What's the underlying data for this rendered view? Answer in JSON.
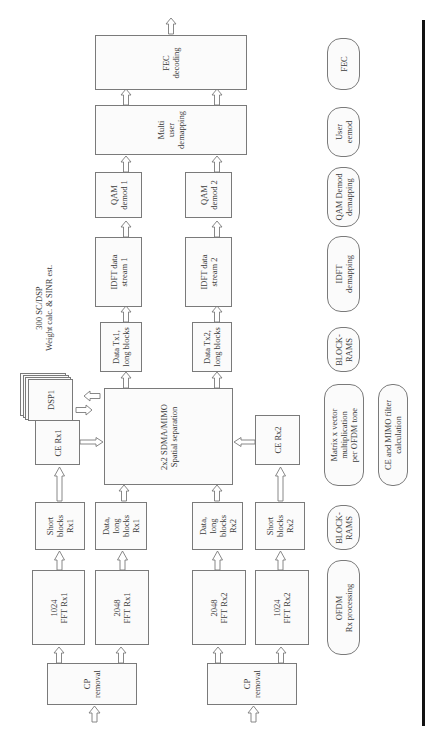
{
  "diagram": {
    "orientation": "rotated-90-ccw",
    "annotation": {
      "lines": [
        "300 SC/DSP",
        "Weight calc. & SINR est."
      ]
    },
    "blocks": {
      "fec_decoding": {
        "lines": [
          "FEC",
          "decoding"
        ]
      },
      "multi_user_demapping": {
        "lines": [
          "Multi",
          "user",
          "demapping"
        ]
      },
      "qam_demod_1": {
        "lines": [
          "QAM",
          "demod 1"
        ]
      },
      "qam_demod_2": {
        "lines": [
          "QAM",
          "demod 2"
        ]
      },
      "idft_stream_1": {
        "lines": [
          "IDFT data",
          "stream 1"
        ]
      },
      "idft_stream_2": {
        "lines": [
          "IDFT data",
          "stream 2"
        ]
      },
      "data_tx1": {
        "lines": [
          "Data Tx1,",
          "long blocks"
        ]
      },
      "data_tx2": {
        "lines": [
          "Data Tx2,",
          "long blocks"
        ]
      },
      "sdma": {
        "lines": [
          "2x2 SDMA/MIMO",
          "Spatial separation"
        ]
      },
      "dsp": {
        "lines": [
          "DSP1"
        ]
      },
      "ce_rx1": {
        "lines": [
          "CE Rx1"
        ]
      },
      "ce_rx2": {
        "lines": [
          "CE Rx2"
        ]
      },
      "short_blocks_rx1": {
        "lines": [
          "Short",
          "blocks",
          "Rx1"
        ]
      },
      "data_long_rx1": {
        "lines": [
          "Data,",
          "long",
          "blocks",
          "Rx1"
        ]
      },
      "data_long_rx2": {
        "lines": [
          "Data,",
          "long",
          "blocks",
          "Rx2"
        ]
      },
      "short_blocks_rx2": {
        "lines": [
          "Short",
          "blocks",
          "Rx2"
        ]
      },
      "fft_1024_rx1": {
        "lines": [
          "1024",
          "FFT Rx1"
        ]
      },
      "fft_2048_rx1": {
        "lines": [
          "2048",
          "FFT Rx1"
        ]
      },
      "fft_2048_rx2": {
        "lines": [
          "2048",
          "FFT Rx2"
        ]
      },
      "fft_1024_rx2": {
        "lines": [
          "1024",
          "FFT Rx2"
        ]
      },
      "cp_removal_1": {
        "lines": [
          "CP",
          "removal"
        ]
      },
      "cp_removal_2": {
        "lines": [
          "CP",
          "removal"
        ]
      }
    },
    "legend": {
      "fec": {
        "lines": [
          "FEC"
        ]
      },
      "user_demod": {
        "lines": [
          "User",
          "eemod"
        ]
      },
      "qam_demapping": {
        "lines": [
          "QAM Demod",
          "demapping"
        ]
      },
      "idft_demapping": {
        "lines": [
          "IDFT",
          "demapping"
        ]
      },
      "block_rams_top": {
        "lines": [
          "BLOCK-",
          "RAMS"
        ]
      },
      "matrix_vector": {
        "lines": [
          "Matrix x vector",
          "multiplication",
          "per OFDM tone"
        ]
      },
      "ce_mimo_filter": {
        "lines": [
          "CE and MIMO filter",
          "calculation"
        ]
      },
      "block_rams_bottom": {
        "lines": [
          "BLOCK-",
          "RAMS"
        ]
      },
      "ofdm_rx": {
        "lines": [
          "OFDM",
          "Rx processing"
        ]
      }
    },
    "colors": {
      "stroke": "#7a7a7a",
      "fill": "#fbfbfb",
      "text": "#3a3a3a",
      "rule": "#111111"
    }
  }
}
